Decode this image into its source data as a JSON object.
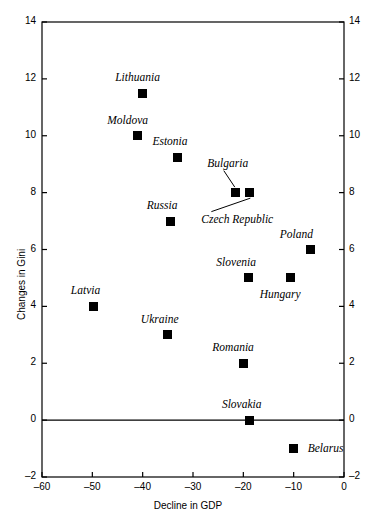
{
  "chart_data": {
    "type": "scatter",
    "title": "",
    "xlabel": "Decline in GDP",
    "ylabel": "Changes in Gini",
    "xlim": [
      -60,
      0
    ],
    "ylim": [
      -2,
      14
    ],
    "xticks": [
      "-60",
      "-50",
      "-40",
      "-30",
      "-20",
      "-10",
      "0"
    ],
    "xtick_values": [
      -60,
      -50,
      -40,
      -30,
      -20,
      -10,
      0
    ],
    "yticks": [
      "-2",
      "0",
      "2",
      "4",
      "6",
      "8",
      "10",
      "12",
      "14"
    ],
    "ytick_values": [
      -2,
      0,
      2,
      4,
      6,
      8,
      10,
      12,
      14
    ],
    "grid": false,
    "legend": false,
    "mirrored_y_axis": true,
    "zero_line": true,
    "marker_style": "filled-square",
    "marker_color": "#000000",
    "points": [
      {
        "label": "Lithuania",
        "x": -40.0,
        "y": 11.5,
        "label_dx": -5,
        "label_dy": -16,
        "leader": false
      },
      {
        "label": "Moldova",
        "x": -41.0,
        "y": 10.0,
        "label_dx": -10,
        "label_dy": -16,
        "leader": false
      },
      {
        "label": "Estonia",
        "x": -33.0,
        "y": 9.25,
        "label_dx": -8,
        "label_dy": -16,
        "leader": false
      },
      {
        "label": "Bulgaria",
        "x": -21.5,
        "y": 8.0,
        "label_dx": -8,
        "label_dy": -30,
        "leader": true,
        "leader_dir": "up"
      },
      {
        "label": "Czech Republic",
        "x": -18.8,
        "y": 8.0,
        "label_dx": -12,
        "label_dy": 26,
        "leader": true,
        "leader_dir": "down"
      },
      {
        "label": "Russia",
        "x": -34.5,
        "y": 7.0,
        "label_dx": -8,
        "label_dy": -16,
        "leader": false
      },
      {
        "label": "Poland",
        "x": -6.7,
        "y": 6.0,
        "label_dx": -14,
        "label_dy": -16,
        "leader": false
      },
      {
        "label": "Slovenia",
        "x": -19.0,
        "y": 5.0,
        "label_dx": -12,
        "label_dy": -16,
        "leader": false
      },
      {
        "label": "Hungary",
        "x": -10.7,
        "y": 5.0,
        "label_dx": -10,
        "label_dy": 16,
        "leader": false
      },
      {
        "label": "Latvia",
        "x": -49.8,
        "y": 4.0,
        "label_dx": -8,
        "label_dy": -16,
        "leader": false
      },
      {
        "label": "Ukraine",
        "x": -35.0,
        "y": 3.0,
        "label_dx": -8,
        "label_dy": -16,
        "leader": false
      },
      {
        "label": "Romania",
        "x": -20.0,
        "y": 2.0,
        "label_dx": -10,
        "label_dy": -16,
        "leader": false
      },
      {
        "label": "Slovakia",
        "x": -18.7,
        "y": 0.0,
        "label_dx": -8,
        "label_dy": -16,
        "leader": false
      },
      {
        "label": "Belarus",
        "x": -10.0,
        "y": -1.0,
        "label_dx": 14,
        "label_dy": 1,
        "leader": false
      }
    ]
  }
}
